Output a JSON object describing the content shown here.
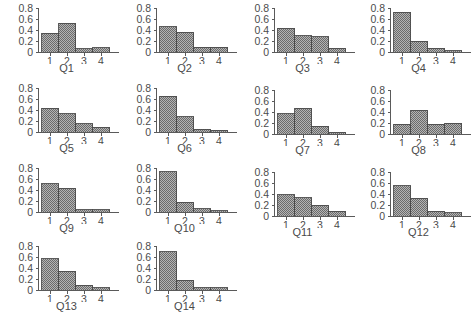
{
  "figure": {
    "panel_count": 14,
    "rows": 4,
    "columns": 4,
    "background_color": "#ffffff",
    "bar_fill_color": "#8f8f8f",
    "bar_edge_color": "#4a4a4a",
    "axis_color": "#5a5a5a",
    "text_color": "#4c4c4c"
  },
  "chart_data": [
    {
      "type": "bar",
      "title": "Q1",
      "xlabel": "",
      "ylabel": "",
      "categories": [
        "1",
        "2",
        "3",
        "4"
      ],
      "values": [
        0.34,
        0.52,
        0.06,
        0.08
      ],
      "ylim": [
        0,
        0.8
      ],
      "yticks": [
        0,
        0.2,
        0.4,
        0.6,
        0.8
      ],
      "ytick_labels": [
        "0",
        "0.2",
        "0.4",
        "0.6",
        "0.8"
      ],
      "grid": false,
      "legend": "none"
    },
    {
      "type": "bar",
      "title": "Q2",
      "xlabel": "",
      "ylabel": "",
      "categories": [
        "1",
        "2",
        "3",
        "4"
      ],
      "values": [
        0.46,
        0.36,
        0.09,
        0.09
      ],
      "ylim": [
        0,
        0.8
      ],
      "yticks": [
        0,
        0.2,
        0.4,
        0.6,
        0.8
      ],
      "ytick_labels": [
        "0",
        "0.2",
        "0.4",
        "0.6",
        "0.8"
      ],
      "grid": false,
      "legend": "none"
    },
    {
      "type": "bar",
      "title": "Q3",
      "xlabel": "",
      "ylabel": "",
      "categories": [
        "1",
        "2",
        "3",
        "4"
      ],
      "values": [
        0.43,
        0.3,
        0.28,
        0.07
      ],
      "ylim": [
        0,
        0.8
      ],
      "yticks": [
        0,
        0.2,
        0.4,
        0.6,
        0.8
      ],
      "ytick_labels": [
        "0",
        "0.2",
        "0.4",
        "0.6",
        "0.8"
      ],
      "grid": false,
      "legend": "none"
    },
    {
      "type": "bar",
      "title": "Q4",
      "xlabel": "",
      "ylabel": "",
      "categories": [
        "1",
        "2",
        "3",
        "4"
      ],
      "values": [
        0.72,
        0.2,
        0.07,
        0.02
      ],
      "ylim": [
        0,
        0.8
      ],
      "yticks": [
        0,
        0.2,
        0.4,
        0.6,
        0.8
      ],
      "ytick_labels": [
        "0",
        "0.2",
        "0.4",
        "0.6",
        "0.8"
      ],
      "grid": false,
      "legend": "none"
    },
    {
      "type": "bar",
      "title": "Q5",
      "xlabel": "",
      "ylabel": "",
      "categories": [
        "1",
        "2",
        "3",
        "4"
      ],
      "values": [
        0.43,
        0.33,
        0.15,
        0.09
      ],
      "ylim": [
        0,
        0.8
      ],
      "yticks": [
        0,
        0.2,
        0.4,
        0.6,
        0.8
      ],
      "ytick_labels": [
        "0",
        "0.2",
        "0.4",
        "0.6",
        "0.8"
      ],
      "grid": false,
      "legend": "none"
    },
    {
      "type": "bar",
      "title": "Q6",
      "xlabel": "",
      "ylabel": "",
      "categories": [
        "1",
        "2",
        "3",
        "4"
      ],
      "values": [
        0.65,
        0.28,
        0.05,
        0.03
      ],
      "ylim": [
        0,
        0.8
      ],
      "yticks": [
        0,
        0.2,
        0.4,
        0.6,
        0.8
      ],
      "ytick_labels": [
        "0",
        "0.2",
        "0.4",
        "0.6",
        "0.8"
      ],
      "grid": false,
      "legend": "none"
    },
    {
      "type": "bar",
      "title": "Q7",
      "xlabel": "",
      "ylabel": "",
      "categories": [
        "1",
        "2",
        "3",
        "4"
      ],
      "values": [
        0.37,
        0.47,
        0.14,
        0.03
      ],
      "ylim": [
        0,
        0.8
      ],
      "yticks": [
        0,
        0.2,
        0.4,
        0.6,
        0.8
      ],
      "ytick_labels": [
        "0",
        "0.2",
        "0.4",
        "0.6",
        "0.8"
      ],
      "grid": false,
      "legend": "none"
    },
    {
      "type": "bar",
      "title": "Q8",
      "xlabel": "",
      "ylabel": "",
      "categories": [
        "1",
        "2",
        "3",
        "4"
      ],
      "values": [
        0.18,
        0.43,
        0.18,
        0.2
      ],
      "ylim": [
        0,
        0.8
      ],
      "yticks": [
        0,
        0.2,
        0.4,
        0.6,
        0.8
      ],
      "ytick_labels": [
        "0",
        "0.2",
        "0.4",
        "0.6",
        "0.8"
      ],
      "grid": false,
      "legend": "none"
    },
    {
      "type": "bar",
      "title": "Q9",
      "xlabel": "",
      "ylabel": "",
      "categories": [
        "1",
        "2",
        "3",
        "4"
      ],
      "values": [
        0.51,
        0.43,
        0.04,
        0.04
      ],
      "ylim": [
        0,
        0.8
      ],
      "yticks": [
        0,
        0.2,
        0.4,
        0.6,
        0.8
      ],
      "ytick_labels": [
        "0",
        "0.2",
        "0.4",
        "0.6",
        "0.8"
      ],
      "grid": false,
      "legend": "none"
    },
    {
      "type": "bar",
      "title": "Q10",
      "xlabel": "",
      "ylabel": "",
      "categories": [
        "1",
        "2",
        "3",
        "4"
      ],
      "values": [
        0.73,
        0.18,
        0.06,
        0.02
      ],
      "ylim": [
        0,
        0.8
      ],
      "yticks": [
        0,
        0.2,
        0.4,
        0.6,
        0.8
      ],
      "ytick_labels": [
        "0",
        "0.2",
        "0.4",
        "0.6",
        "0.8"
      ],
      "grid": false,
      "legend": "none"
    },
    {
      "type": "bar",
      "title": "Q11",
      "xlabel": "",
      "ylabel": "",
      "categories": [
        "1",
        "2",
        "3",
        "4"
      ],
      "values": [
        0.39,
        0.33,
        0.2,
        0.09
      ],
      "ylim": [
        0,
        0.8
      ],
      "yticks": [
        0,
        0.2,
        0.4,
        0.6,
        0.8
      ],
      "ytick_labels": [
        "0",
        "0.2",
        "0.4",
        "0.6",
        "0.8"
      ],
      "grid": false,
      "legend": "none"
    },
    {
      "type": "bar",
      "title": "Q12",
      "xlabel": "",
      "ylabel": "",
      "categories": [
        "1",
        "2",
        "3",
        "4"
      ],
      "values": [
        0.55,
        0.32,
        0.09,
        0.06
      ],
      "ylim": [
        0,
        0.8
      ],
      "yticks": [
        0,
        0.2,
        0.4,
        0.6,
        0.8
      ],
      "ytick_labels": [
        "0",
        "0.2",
        "0.4",
        "0.6",
        "0.8"
      ],
      "grid": false,
      "legend": "none"
    },
    {
      "type": "bar",
      "title": "Q13",
      "xlabel": "",
      "ylabel": "",
      "categories": [
        "1",
        "2",
        "3",
        "4"
      ],
      "values": [
        0.57,
        0.34,
        0.09,
        0.04
      ],
      "ylim": [
        0,
        0.8
      ],
      "yticks": [
        0,
        0.2,
        0.4,
        0.6,
        0.8
      ],
      "ytick_labels": [
        "0",
        "0.2",
        "0.4",
        "0.6",
        "0.8"
      ],
      "grid": false,
      "legend": "none"
    },
    {
      "type": "bar",
      "title": "Q14",
      "xlabel": "",
      "ylabel": "",
      "categories": [
        "1",
        "2",
        "3",
        "4"
      ],
      "values": [
        0.7,
        0.18,
        0.04,
        0.04
      ],
      "ylim": [
        0,
        0.8
      ],
      "yticks": [
        0,
        0.2,
        0.4,
        0.6,
        0.8
      ],
      "ytick_labels": [
        "0",
        "0.2",
        "0.4",
        "0.6",
        "0.8"
      ],
      "grid": false,
      "legend": "none"
    }
  ]
}
